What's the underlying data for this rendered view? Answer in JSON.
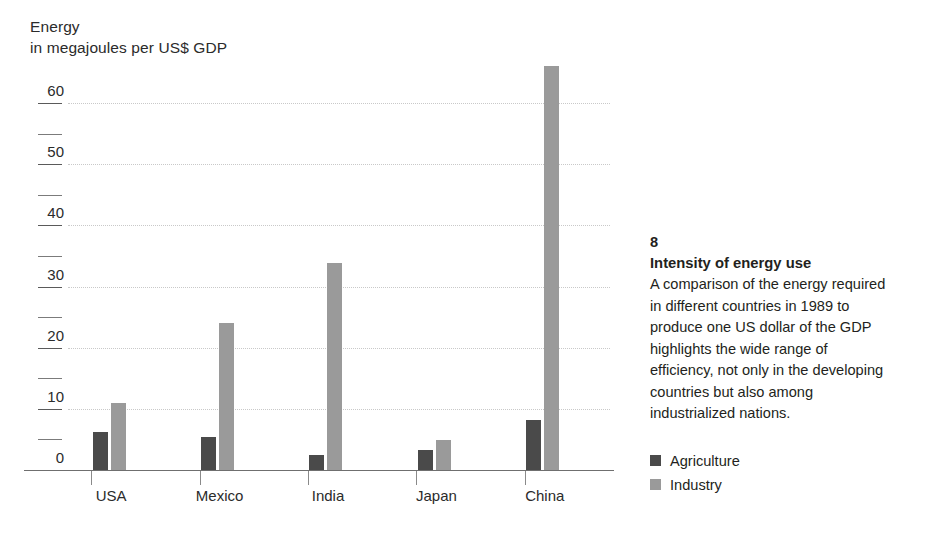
{
  "chart_data": {
    "type": "bar",
    "title": "Energy",
    "subtitle": "in megajoules per US$ GDP",
    "ylabel": "Energy in megajoules per US$ GDP",
    "xlabel": "",
    "categories": [
      "USA",
      "Mexico",
      "India",
      "Japan",
      "China"
    ],
    "series": [
      {
        "name": "Agriculture",
        "color": "#4a4a4a",
        "values": [
          6.2,
          5.4,
          2.5,
          3.3,
          8.2
        ]
      },
      {
        "name": "Industry",
        "color": "#9a9a9a",
        "values": [
          11.0,
          24.0,
          33.8,
          4.9,
          66.0
        ]
      }
    ],
    "ylim": [
      0,
      60
    ],
    "yticks": [
      0,
      10,
      20,
      30,
      40,
      50,
      60
    ],
    "ytick_labels": [
      "0",
      "10",
      "20",
      "30",
      "40",
      "50",
      "60"
    ],
    "yminor_ticks": [
      5,
      15,
      25,
      35,
      45,
      55
    ],
    "grid": "horizontal-dotted",
    "legend_position": "right",
    "annotations": []
  },
  "axis_title": {
    "line1": "Energy",
    "line2": "in megajoules per US$ GDP"
  },
  "caption": {
    "number": "8",
    "headline": "Intensity of energy use",
    "body": "A comparison of the energy required in different countries in 1989 to produce one US dollar of the GDP highlights the wide range of efficiency, not only in the developing countries but also among industrialized nations."
  },
  "legend": {
    "items": [
      {
        "label": "Agriculture",
        "color": "#4a4a4a"
      },
      {
        "label": "Industry",
        "color": "#9a9a9a"
      }
    ]
  },
  "colors": {
    "agriculture": "#4a4a4a",
    "industry": "#9a9a9a",
    "gridline": "#c9c9c9",
    "axis": "#6f6f6f",
    "text": "#231f20",
    "background": "#ffffff"
  }
}
